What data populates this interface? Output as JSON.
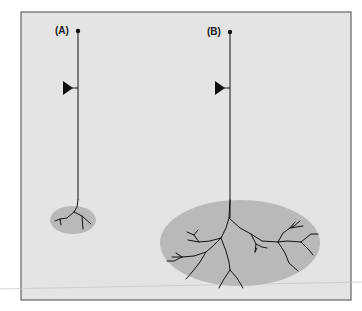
{
  "figure": {
    "background": "#ffffff",
    "panel_fill": "#e4e4e4",
    "panel_border": "#6e6e6e",
    "field_fill": "#b9b9b9",
    "line_color": "#111111"
  },
  "neurons": [
    {
      "id": "A",
      "label": "(A)",
      "description": "Neuron with small dendritic field"
    },
    {
      "id": "B",
      "label": "(B)",
      "description": "Neuron with large dendritic field"
    }
  ]
}
